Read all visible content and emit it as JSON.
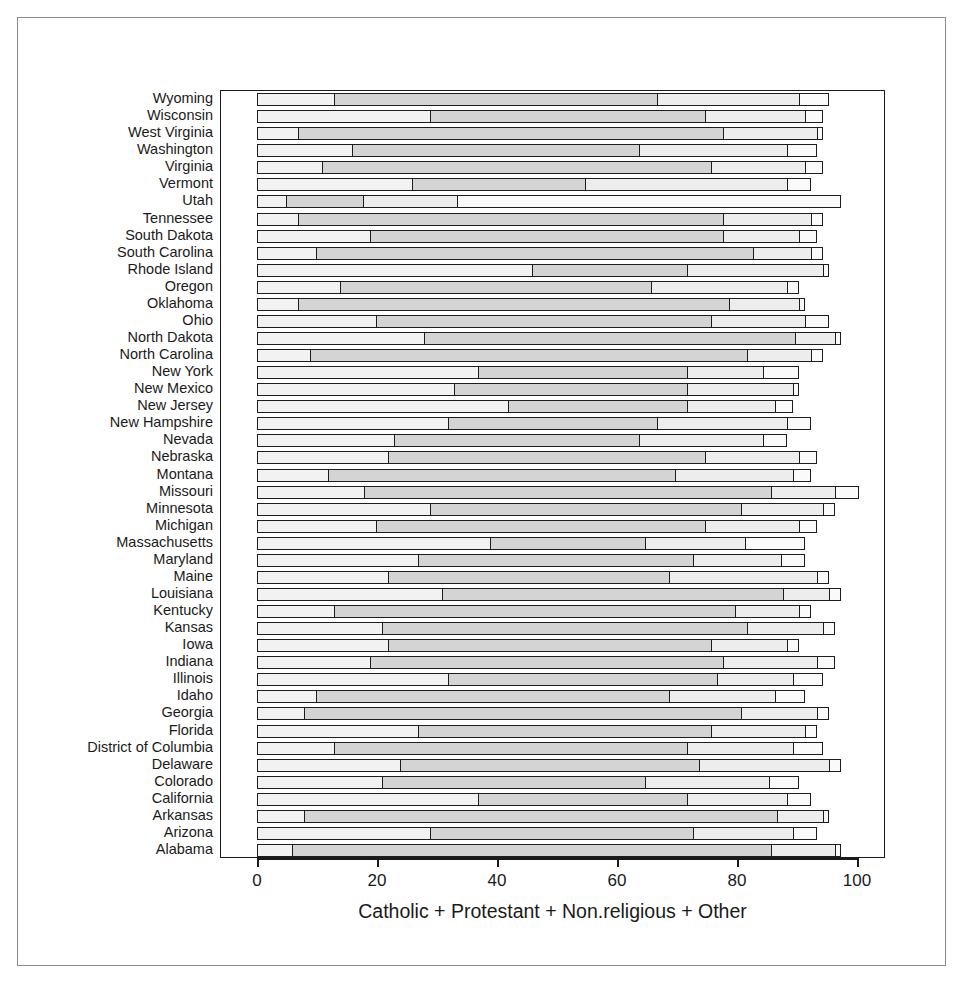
{
  "chart_data": {
    "type": "bar",
    "subtype": "stacked-horizontal",
    "title": "",
    "xlabel": "Catholic + Protestant + Non.religious + Other",
    "ylabel": "",
    "xlim": [
      0,
      105
    ],
    "xticks": [
      0,
      20,
      40,
      60,
      80,
      100
    ],
    "xticklabels": [
      "0",
      "20",
      "40",
      "60",
      "80",
      "100"
    ],
    "grid": false,
    "legend": "none",
    "series_names": [
      "Catholic",
      "Protestant",
      "Non.religious",
      "Other"
    ],
    "series_colors": [
      "#f2f2f2",
      "#d4d4d4",
      "#ededed",
      "#fafafa"
    ],
    "categories": [
      "Wyoming",
      "Wisconsin",
      "West Virginia",
      "Washington",
      "Virginia",
      "Vermont",
      "Utah",
      "Tennessee",
      "South Dakota",
      "South Carolina",
      "Rhode Island",
      "Oregon",
      "Oklahoma",
      "Ohio",
      "North Dakota",
      "North Carolina",
      "New York",
      "New Mexico",
      "New Jersey",
      "New Hampshire",
      "Nevada",
      "Nebraska",
      "Montana",
      "Missouri",
      "Minnesota",
      "Michigan",
      "Massachusetts",
      "Maryland",
      "Maine",
      "Louisiana",
      "Kentucky",
      "Kansas",
      "Iowa",
      "Indiana",
      "Illinois",
      "Idaho",
      "Georgia",
      "Florida",
      "District of Columbia",
      "Delaware",
      "Colorado",
      "California",
      "Arkansas",
      "Arizona",
      "Alabama"
    ],
    "series": [
      {
        "name": "Catholic",
        "values": [
          13,
          29,
          7,
          16,
          11,
          26,
          5,
          7,
          19,
          10,
          46,
          14,
          7,
          20,
          28,
          9,
          37,
          33,
          42,
          32,
          23,
          22,
          12,
          18,
          29,
          20,
          39,
          27,
          22,
          31,
          13,
          21,
          22,
          19,
          32,
          10,
          8,
          27,
          13,
          24,
          21,
          37,
          8,
          29,
          6
        ]
      },
      {
        "name": "Protestant",
        "values": [
          54,
          46,
          71,
          48,
          65,
          29,
          13,
          71,
          59,
          73,
          26,
          52,
          72,
          56,
          62,
          73,
          35,
          39,
          30,
          35,
          41,
          53,
          58,
          68,
          52,
          55,
          26,
          46,
          47,
          57,
          67,
          61,
          54,
          59,
          45,
          59,
          73,
          49,
          59,
          50,
          44,
          35,
          79,
          44,
          80
        ]
      },
      {
        "name": "Non.religious",
        "values": [
          24,
          17,
          16,
          25,
          16,
          34,
          16,
          15,
          13,
          10,
          23,
          23,
          12,
          16,
          7,
          11,
          13,
          18,
          15,
          22,
          21,
          16,
          20,
          11,
          14,
          16,
          17,
          15,
          25,
          8,
          11,
          13,
          13,
          16,
          13,
          18,
          13,
          16,
          18,
          22,
          21,
          17,
          8,
          17,
          11
        ]
      },
      {
        "name": "Other",
        "values": [
          5,
          3,
          1,
          5,
          3,
          4,
          64,
          2,
          3,
          2,
          1,
          2,
          1,
          4,
          1,
          2,
          6,
          1,
          3,
          4,
          4,
          3,
          3,
          4,
          2,
          3,
          10,
          4,
          2,
          2,
          2,
          2,
          2,
          3,
          5,
          5,
          2,
          2,
          5,
          2,
          5,
          4,
          1,
          4,
          1
        ]
      }
    ]
  },
  "axis": {
    "x_title": "Catholic + Protestant + Non.religious + Other"
  }
}
